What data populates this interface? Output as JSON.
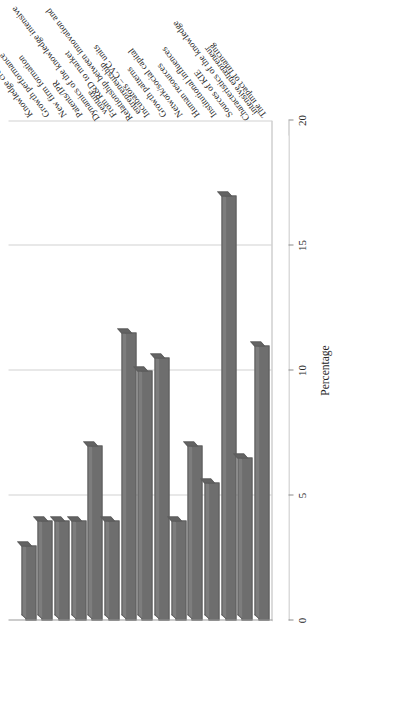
{
  "chart_data": {
    "type": "bar",
    "orientation": "horizontal",
    "title": "",
    "xlabel": "Percentage",
    "ylabel": "",
    "xlim": [
      0,
      20
    ],
    "xticks": [
      "0",
      "5",
      "10",
      "15",
      "20"
    ],
    "grid": true,
    "legend": "none",
    "style": "3d-bar",
    "bar_color": "#6e6e6e",
    "categories": [
      "The impact of financing",
      "Characteristics of the knowledge intensive entrepreneur",
      "Sources of KIE",
      "Institutional influences",
      "Human resources",
      "Network/social capital",
      "Growth patterns",
      "Incubators – CVC units",
      "Relationship between innovation and entrepreneurship",
      "From R&D to market",
      "Dynamics of the knowledge intensive venture",
      "Patents/IPR",
      "New firm formation",
      "Growth performance",
      "Knowledge creation"
    ],
    "values": [
      11,
      6.5,
      17,
      5.5,
      7,
      4,
      10.5,
      10,
      11.5,
      4,
      7,
      4,
      4,
      4,
      3
    ]
  },
  "axis": {
    "value_axis_title": "Percentage"
  }
}
